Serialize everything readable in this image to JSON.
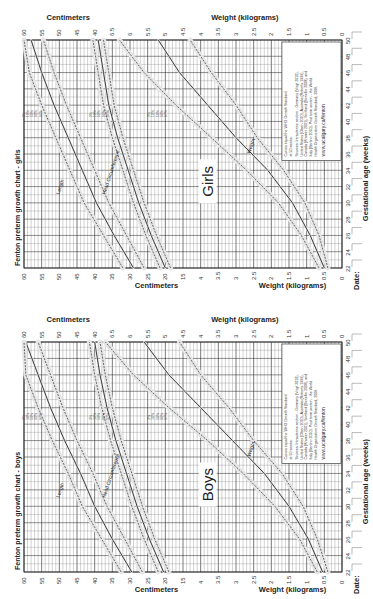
{
  "chart_data": [
    {
      "type": "line",
      "title": "Fenton preterm growth chart - girls",
      "sex_label": "Girls",
      "xlabel": "Gestational age (weeks)",
      "ylabel_cm": "Centimeters",
      "ylabel_kg": "Weight (kilograms)",
      "footer_label": "Date:",
      "x_ticks": [
        22,
        24,
        26,
        28,
        30,
        32,
        34,
        36,
        38,
        40,
        42,
        44,
        46,
        48,
        50
      ],
      "cm_ticks_top": [
        "60",
        "55",
        "50",
        "45",
        "40",
        "6.5",
        "6",
        "5.5",
        "5",
        "4.5",
        "4",
        "3.5",
        "3",
        "2.5",
        "2",
        "1.5",
        "1",
        "0.5",
        "0"
      ],
      "cm_ticks_bottom": [
        "60",
        "55",
        "50",
        "45",
        "40",
        "35",
        "30",
        "25",
        "20",
        "15",
        "4",
        "3.5",
        "3",
        "2.5",
        "2",
        "1.5",
        "1",
        "0.5",
        "0"
      ],
      "percentiles": [
        "3%",
        "10%",
        "50%",
        "90%",
        "97%"
      ],
      "curve_names": [
        "Length",
        "Head Circumference",
        "Weight"
      ],
      "note_lines": [
        "Curves equal the WHO Growth Standard",
        "at 50 weeks.",
        "Sources: Intrauterine section - Germany (Voigt 2010),",
        "United States (Olsen 2010), Australia (Roberts 1999),",
        "Canada (Kramer 2001), Scotland (Bonellie 2008), and",
        "Italy (Bertino 2010). Post term section - the World",
        "Health Organization Growth Standard, 2006."
      ],
      "note_url": "www.ucalgary.ca/fenton",
      "series": [
        {
          "name": "Length 50%",
          "x": [
            22,
            26,
            30,
            34,
            38,
            42,
            46,
            50
          ],
          "values": [
            29,
            34.5,
            39.5,
            43.5,
            47.5,
            51.5,
            55,
            58
          ]
        },
        {
          "name": "Length 3%",
          "x": [
            22,
            26,
            30,
            34,
            38,
            42,
            46,
            50
          ],
          "values": [
            26,
            31,
            36,
            40,
            44,
            48,
            51.5,
            54.5
          ]
        },
        {
          "name": "Length 97%",
          "x": [
            22,
            26,
            30,
            34,
            38,
            42,
            46,
            50
          ],
          "values": [
            32,
            37.5,
            43,
            47,
            51,
            55,
            58.5,
            61.5
          ]
        },
        {
          "name": "Head Circumference 50%",
          "x": [
            22,
            26,
            30,
            34,
            38,
            42,
            46,
            50
          ],
          "values": [
            20,
            24,
            27.5,
            30.5,
            33.5,
            36,
            37.5,
            39
          ]
        },
        {
          "name": "Head Circumference 3%",
          "x": [
            22,
            26,
            30,
            34,
            38,
            42,
            46,
            50
          ],
          "values": [
            18.5,
            22.5,
            26,
            29,
            32,
            34.5,
            36,
            37.5
          ]
        },
        {
          "name": "Head Circumference 97%",
          "x": [
            22,
            26,
            30,
            34,
            38,
            42,
            46,
            50
          ],
          "values": [
            21.5,
            25.5,
            29,
            32,
            35,
            37.5,
            39,
            40.5
          ]
        },
        {
          "name": "Weight 50%",
          "x": [
            22,
            26,
            30,
            34,
            38,
            42,
            46,
            50
          ],
          "values": [
            0.5,
            0.9,
            1.4,
            2.1,
            3.0,
            3.8,
            4.6,
            5.2
          ]
        },
        {
          "name": "Weight 3%",
          "x": [
            22,
            26,
            30,
            34,
            38,
            42,
            46,
            50
          ],
          "values": [
            0.4,
            0.65,
            1.05,
            1.65,
            2.4,
            3.0,
            3.7,
            4.3
          ]
        },
        {
          "name": "Weight 97%",
          "x": [
            22,
            26,
            30,
            34,
            38,
            42,
            46,
            50
          ],
          "values": [
            0.65,
            1.15,
            1.8,
            2.7,
            3.7,
            4.7,
            5.6,
            6.3
          ]
        }
      ]
    },
    {
      "type": "line",
      "title": "Fenton preterm growth chart - boys",
      "sex_label": "Boys",
      "xlabel": "Gestational age (weeks)",
      "ylabel_cm": "Centimeters",
      "ylabel_kg": "Weight (kilograms)",
      "footer_label": "Date:",
      "x_ticks": [
        22,
        24,
        26,
        28,
        30,
        32,
        34,
        36,
        38,
        40,
        42,
        44,
        46,
        48,
        50
      ],
      "cm_ticks_top": [
        "60",
        "55",
        "50",
        "45",
        "40",
        "6.5",
        "6",
        "5.5",
        "5",
        "4.5",
        "4",
        "3.5",
        "3",
        "2.5",
        "2",
        "1.5",
        "1",
        "0.5",
        "0"
      ],
      "cm_ticks_bottom": [
        "60",
        "55",
        "50",
        "45",
        "40",
        "35",
        "30",
        "25",
        "20",
        "15",
        "4",
        "3.5",
        "3",
        "2.5",
        "2",
        "1.5",
        "1",
        "0.5",
        "0"
      ],
      "percentiles": [
        "3%",
        "10%",
        "50%",
        "90%",
        "97%"
      ],
      "curve_names": [
        "Length",
        "Head Circumference",
        "Weight"
      ],
      "note_lines": [
        "Curves equal the WHO Growth Standard",
        "at 50 weeks.",
        "Sources: Intrauterine section - Germany (Voigt 2010),",
        "United States (Olsen 2010), Australia (Roberts 1999),",
        "Canada (Kramer 2001), Scotland (Bonellie 2008), and",
        "Italy (Bertino 2010). Post term section - the World",
        "Health Organization Growth Standard, 2006."
      ],
      "note_url": "www.ucalgary.ca/fenton",
      "series": [
        {
          "name": "Length 50%",
          "x": [
            22,
            26,
            30,
            34,
            38,
            42,
            46,
            50
          ],
          "values": [
            29.5,
            35,
            40,
            44,
            48.5,
            52.5,
            56,
            59.5
          ]
        },
        {
          "name": "Length 3%",
          "x": [
            22,
            26,
            30,
            34,
            38,
            42,
            46,
            50
          ],
          "values": [
            26.5,
            31.5,
            36.5,
            40.5,
            45,
            49,
            52.5,
            56
          ]
        },
        {
          "name": "Length 97%",
          "x": [
            22,
            26,
            30,
            34,
            38,
            42,
            46,
            50
          ],
          "values": [
            32.5,
            38,
            43.5,
            47.5,
            52,
            56,
            59.5,
            63
          ]
        },
        {
          "name": "Head Circumference 50%",
          "x": [
            22,
            26,
            30,
            34,
            38,
            42,
            46,
            50
          ],
          "values": [
            20.5,
            24.5,
            28,
            31,
            34,
            36.5,
            38.5,
            40
          ]
        },
        {
          "name": "Head Circumference 3%",
          "x": [
            22,
            26,
            30,
            34,
            38,
            42,
            46,
            50
          ],
          "values": [
            19,
            23,
            26.5,
            29.5,
            32.5,
            35,
            37,
            38.5
          ]
        },
        {
          "name": "Head Circumference 97%",
          "x": [
            22,
            26,
            30,
            34,
            38,
            42,
            46,
            50
          ],
          "values": [
            22,
            26,
            29.5,
            32.5,
            35.5,
            38,
            40,
            41.5
          ]
        },
        {
          "name": "Weight 50%",
          "x": [
            22,
            26,
            30,
            34,
            38,
            42,
            46,
            50
          ],
          "values": [
            0.55,
            0.95,
            1.5,
            2.2,
            3.1,
            4.0,
            4.9,
            5.6
          ]
        },
        {
          "name": "Weight 3%",
          "x": [
            22,
            26,
            30,
            34,
            38,
            42,
            46,
            50
          ],
          "values": [
            0.4,
            0.7,
            1.1,
            1.7,
            2.5,
            3.2,
            4.0,
            4.6
          ]
        },
        {
          "name": "Weight 97%",
          "x": [
            22,
            26,
            30,
            34,
            38,
            42,
            46,
            50
          ],
          "values": [
            0.7,
            1.2,
            1.9,
            2.8,
            3.8,
            4.9,
            5.9,
            6.7
          ]
        }
      ]
    }
  ]
}
